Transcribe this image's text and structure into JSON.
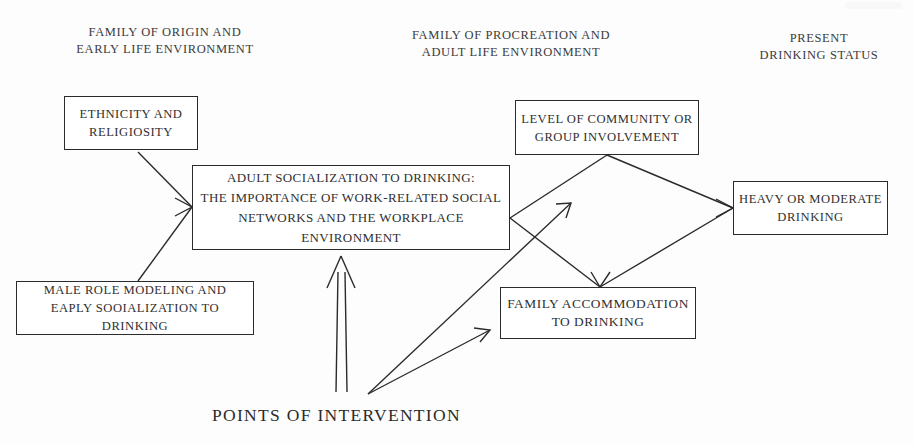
{
  "diagram": {
    "title_caption": "POINTS OF INTERVENTION",
    "column_headers": [
      {
        "id": "family-of-origin",
        "text": "FAMILY OF ORIGIN AND\nEARLY LIFE ENVIRONMENT"
      },
      {
        "id": "family-of-procreation",
        "text": "FAMILY OF PROCREATION AND\nADULT LIFE ENVIRONMENT"
      },
      {
        "id": "present-drinking-status",
        "text": "PRESENT\nDRINKING STATUS"
      }
    ],
    "nodes": [
      {
        "id": "ethnicity",
        "text": "ETHNICITY AND\nRELIGIOSITY"
      },
      {
        "id": "male-role-modeling",
        "text": "MALE ROLE MODELING AND\nEAPLY SOOIALIZATION TO DRINKING"
      },
      {
        "id": "adult-socialization",
        "text": "ADULT SOCIALIZATION TO DRINKING:\nTHE IMPORTANCE OF WORK-RELATED SOCIAL\nNETWORKS AND THE WORKPLACE ENVIRONMENT"
      },
      {
        "id": "community-involvement",
        "text": "LEVEL OF COMMUNITY OR\nGROUP INVOLVEMENT"
      },
      {
        "id": "family-accommodation",
        "text": "FAMILY ACCOMMODATION\nTO DRINKING"
      },
      {
        "id": "heavy-moderate-drinking",
        "text": "HEAVY OR MODERATE\nDRINKING"
      }
    ],
    "colors": {
      "background": "#fdfdfd",
      "line": "#2b2b2b",
      "text": "#303030"
    }
  }
}
